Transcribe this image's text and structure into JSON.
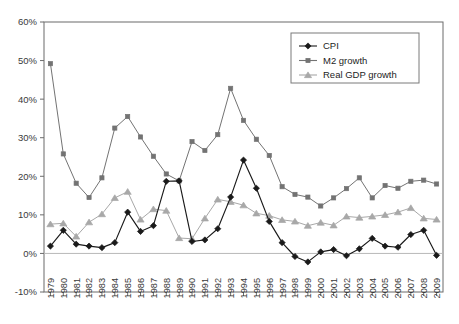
{
  "chart_data": {
    "type": "line",
    "title": "",
    "xlabel": "",
    "ylabel": "",
    "grid": false,
    "legend_position": "top-right",
    "ylim": [
      -10,
      60
    ],
    "ytick_labels": [
      "60%",
      "50%",
      "40%",
      "30%",
      "20%",
      "10%",
      "0%",
      "-10%"
    ],
    "ytick_values": [
      60,
      50,
      40,
      30,
      20,
      10,
      0,
      -10
    ],
    "categories": [
      "1979",
      "1980",
      "1981",
      "1982",
      "1983",
      "1984",
      "1985",
      "1986",
      "1987",
      "1988",
      "1989",
      "1990",
      "1991",
      "1992",
      "1993",
      "1994",
      "1995",
      "1996",
      "1997",
      "1998",
      "1999",
      "2000",
      "2001",
      "2002",
      "2003",
      "2004",
      "2005",
      "2006",
      "2007",
      "2008",
      "2009"
    ],
    "series": [
      {
        "name": "CPI",
        "marker": "diamond",
        "color": "#1a1a1a",
        "values": [
          1.9,
          6.0,
          2.4,
          1.9,
          1.5,
          2.8,
          10.7,
          5.7,
          7.2,
          18.7,
          18.8,
          3.1,
          3.5,
          6.4,
          14.6,
          24.2,
          16.9,
          8.3,
          2.8,
          -0.8,
          -2.2,
          0.4,
          1.0,
          -0.6,
          1.2,
          3.9,
          1.9,
          1.6,
          4.9,
          6.0,
          -0.5
        ]
      },
      {
        "name": "M2 growth",
        "marker": "square",
        "color": "#737373",
        "values": [
          49.2,
          25.8,
          18.2,
          14.5,
          19.6,
          32.5,
          35.5,
          30.2,
          25.2,
          20.6,
          18.8,
          29.0,
          26.7,
          30.8,
          42.8,
          34.5,
          29.6,
          25.4,
          17.3,
          15.3,
          14.6,
          12.3,
          14.4,
          16.8,
          19.6,
          14.4,
          17.6,
          16.9,
          18.7,
          19.0,
          18.0
        ]
      },
      {
        "name": "Real GDP growth",
        "marker": "triangle",
        "color": "#a8a8a8",
        "values": [
          7.6,
          7.8,
          4.4,
          8.1,
          10.2,
          14.4,
          16.0,
          8.8,
          11.5,
          11.1,
          4.0,
          3.8,
          9.1,
          14.0,
          13.4,
          12.5,
          10.4,
          9.8,
          8.7,
          8.3,
          7.2,
          8.0,
          7.3,
          9.6,
          9.3,
          9.6,
          10.0,
          10.7,
          11.8,
          9.1,
          8.8
        ]
      }
    ]
  },
  "legend": {
    "entries": [
      {
        "label": "CPI"
      },
      {
        "label": "M2 growth"
      },
      {
        "label": "Real GDP growth"
      }
    ]
  }
}
